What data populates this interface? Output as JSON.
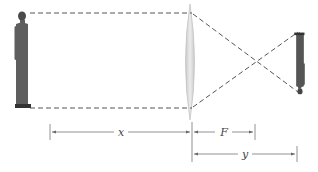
{
  "diagram": {
    "type": "thin-lens image formation",
    "colors": {
      "ray": "#555555",
      "lens_fill": "#d9d9d9",
      "lens_edge": "#bdbdbd",
      "figure": "#5a5a5a",
      "dimension": "#666666"
    },
    "object": {
      "label": "person (object)",
      "orientation": "upright"
    },
    "image": {
      "label": "person (image)",
      "orientation": "inverted"
    },
    "lens": {
      "label": "converging lens"
    },
    "dimensions": {
      "x": "x",
      "F": "F",
      "y": "y"
    }
  }
}
